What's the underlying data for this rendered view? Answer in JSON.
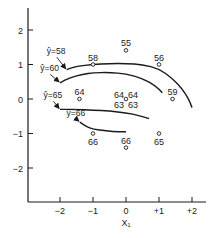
{
  "chart_data": {
    "type": "scatter",
    "title": "",
    "xlabel": "X₁",
    "ylabel": "",
    "xlim": [
      -2.9,
      2.4
    ],
    "ylim": [
      -2.9,
      2.6
    ],
    "grid": false,
    "x_ticks": [
      {
        "value": -2,
        "label": "−2"
      },
      {
        "value": -1,
        "label": "−1"
      },
      {
        "value": 0,
        "label": "0"
      },
      {
        "value": 1,
        "label": "+1"
      },
      {
        "value": 2,
        "label": "+2"
      }
    ],
    "y_ticks": [
      {
        "value": 2,
        "label": "2"
      },
      {
        "value": 1,
        "label": "1"
      },
      {
        "value": 0,
        "label": "0"
      },
      {
        "value": -1,
        "label": "−1"
      },
      {
        "value": -2,
        "label": "−2"
      }
    ],
    "points": [
      {
        "x": -1,
        "y": 1,
        "label": "58",
        "label_pos": "above"
      },
      {
        "x": 0,
        "y": 1.41,
        "label": "55",
        "label_pos": "above"
      },
      {
        "x": 1,
        "y": 1,
        "label": "56",
        "label_pos": "above"
      },
      {
        "x": -1.41,
        "y": 0,
        "label": "64",
        "label_pos": "above"
      },
      {
        "x": 0,
        "y": 0,
        "label": "64 64 63 63",
        "label_pos": "center-quad",
        "replicates": [
          64,
          64,
          63,
          63
        ]
      },
      {
        "x": 1.41,
        "y": 0,
        "label": "59",
        "label_pos": "above"
      },
      {
        "x": -1,
        "y": -1,
        "label": "66",
        "label_pos": "below"
      },
      {
        "x": 0,
        "y": -1.41,
        "label": "66",
        "label_pos": "above"
      },
      {
        "x": 1,
        "y": -1,
        "label": "65",
        "label_pos": "below"
      }
    ],
    "contours": [
      {
        "name": "ŷ=58",
        "level": 58,
        "path": [
          [
            -1.8,
            0.85
          ],
          [
            -1.5,
            0.95
          ],
          [
            -1,
            1.0
          ],
          [
            -0.5,
            1.03
          ],
          [
            0,
            1.03
          ],
          [
            0.5,
            1.0
          ],
          [
            1.0,
            0.88
          ],
          [
            1.4,
            0.6
          ],
          [
            1.7,
            0.3
          ],
          [
            1.9,
            0.0
          ],
          [
            2.0,
            -0.25
          ]
        ],
        "label_xy": [
          -2.4,
          1.3
        ],
        "arrow_to": [
          -1.8,
          0.85
        ]
      },
      {
        "name": "ŷ=60",
        "level": 60,
        "path": [
          [
            -2.0,
            0.47
          ],
          [
            -1.7,
            0.62
          ],
          [
            -1.3,
            0.72
          ],
          [
            -1,
            0.76
          ],
          [
            -0.5,
            0.77
          ],
          [
            0,
            0.73
          ],
          [
            0.5,
            0.6
          ],
          [
            0.9,
            0.38
          ],
          [
            1.1,
            0.18
          ]
        ],
        "label_xy": [
          -2.6,
          0.8
        ],
        "arrow_to": [
          -2.0,
          0.47
        ]
      },
      {
        "name": "ŷ=65",
        "level": 65,
        "path": [
          [
            -2.0,
            -0.3
          ],
          [
            -1.5,
            -0.3
          ],
          [
            -1,
            -0.32
          ],
          [
            -0.5,
            -0.35
          ],
          [
            0,
            -0.4
          ],
          [
            0.4,
            -0.48
          ],
          [
            0.7,
            -0.57
          ]
        ],
        "label_xy": [
          -2.5,
          0.02
        ],
        "arrow_to": [
          -2.0,
          -0.3
        ]
      },
      {
        "name": "ŷ=66",
        "level": 66,
        "path": [
          [
            -1.4,
            -0.67
          ],
          [
            -1.2,
            -0.8
          ],
          [
            -1.0,
            -0.87
          ],
          [
            -0.6,
            -0.93
          ],
          [
            -0.2,
            -0.95
          ],
          [
            0.0,
            -0.95
          ]
        ],
        "label_xy": [
          -1.8,
          -0.5
        ],
        "arrow_to": [
          -1.4,
          -0.67
        ]
      }
    ]
  }
}
